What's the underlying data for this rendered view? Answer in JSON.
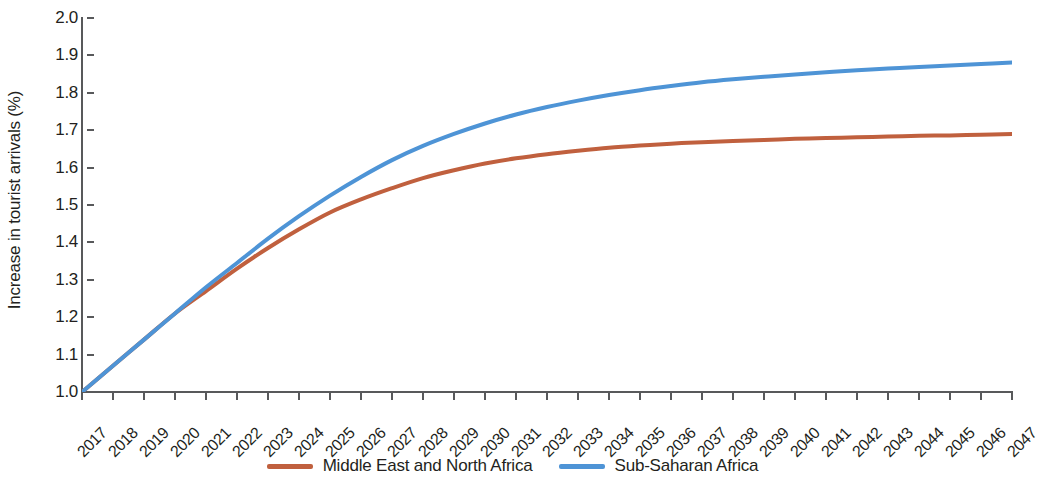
{
  "chart_data": {
    "type": "line",
    "title": "",
    "xlabel": "",
    "ylabel": "Increase in tourist arrivals (%)",
    "ylim": [
      1.0,
      2.0
    ],
    "ytick_labels": [
      "2.0",
      "1.9",
      "1.8",
      "1.7",
      "1.6",
      "1.5",
      "1.4",
      "1.3",
      "1.2",
      "1.1",
      "1.0"
    ],
    "ytick_values": [
      2.0,
      1.9,
      1.8,
      1.7,
      1.6,
      1.5,
      1.4,
      1.3,
      1.2,
      1.1,
      1.0
    ],
    "grid": false,
    "legend_position": "bottom-center",
    "categories": [
      "2017",
      "2018",
      "2019",
      "2020",
      "2021",
      "2022",
      "2023",
      "2024",
      "2025",
      "2026",
      "2027",
      "2028",
      "2029",
      "2030",
      "2031",
      "2032",
      "2033",
      "2034",
      "2035",
      "2036",
      "2037",
      "2038",
      "2039",
      "2040",
      "2041",
      "2042",
      "2043",
      "2044",
      "2045",
      "2046",
      "2047"
    ],
    "x": [
      2017,
      2018,
      2019,
      2020,
      2021,
      2022,
      2023,
      2024,
      2025,
      2026,
      2027,
      2028,
      2029,
      2030,
      2031,
      2032,
      2033,
      2034,
      2035,
      2036,
      2037,
      2038,
      2039,
      2040,
      2041,
      2042,
      2043,
      2044,
      2045,
      2046,
      2047
    ],
    "series": [
      {
        "name": "Middle East and North Africa",
        "color": "#c0603e",
        "values": [
          1.0,
          1.07,
          1.14,
          1.21,
          1.27,
          1.33,
          1.385,
          1.435,
          1.48,
          1.515,
          1.545,
          1.572,
          1.593,
          1.611,
          1.625,
          1.636,
          1.645,
          1.653,
          1.659,
          1.664,
          1.668,
          1.671,
          1.674,
          1.677,
          1.679,
          1.681,
          1.683,
          1.685,
          1.686,
          1.688,
          1.69
        ]
      },
      {
        "name": "Sub-Saharan Africa",
        "color": "#4e94d6",
        "values": [
          1.0,
          1.07,
          1.14,
          1.21,
          1.28,
          1.345,
          1.41,
          1.47,
          1.525,
          1.575,
          1.62,
          1.658,
          1.69,
          1.718,
          1.742,
          1.762,
          1.779,
          1.794,
          1.807,
          1.818,
          1.828,
          1.836,
          1.843,
          1.849,
          1.855,
          1.86,
          1.865,
          1.869,
          1.873,
          1.877,
          1.881
        ]
      }
    ]
  },
  "legend": {
    "items": [
      {
        "label": "Middle East and North Africa",
        "color": "#c0603e"
      },
      {
        "label": "Sub-Saharan Africa",
        "color": "#4e94d6"
      }
    ]
  }
}
